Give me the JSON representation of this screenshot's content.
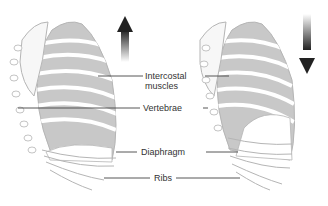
{
  "diagram": {
    "left_panel": {
      "name": "inhalation",
      "arrow_direction": "up"
    },
    "right_panel": {
      "name": "exhalation",
      "arrow_direction": "down"
    },
    "labels": {
      "intercostal_line1": "Intercostal",
      "intercostal_line2": "muscles",
      "vertebrae": "Vertebrae",
      "diaphragm": "Diaphragm",
      "ribs": "Ribs"
    },
    "colors": {
      "muscle_fill": "#c8c8c8",
      "rib_fill": "#ffffff",
      "outline": "#b5b5b5",
      "leader_line": "#444444",
      "arrow_dark": "#222222",
      "text": "#333333"
    }
  }
}
